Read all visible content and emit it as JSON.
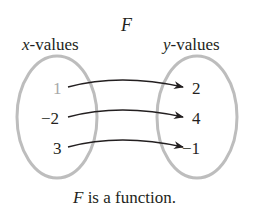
{
  "diagram": {
    "title": "F",
    "domain_label_var": "x",
    "domain_label_rest": "-values",
    "range_label_var": "y",
    "range_label_rest": "-values",
    "domain_values": [
      "1",
      "−2",
      "3"
    ],
    "range_values": [
      "2",
      "4",
      "−1"
    ],
    "mappings": [
      {
        "from": "1",
        "to": "2"
      },
      {
        "from": "−2",
        "to": "4"
      },
      {
        "from": "3",
        "to": "−1"
      }
    ],
    "caption_var": "F",
    "caption_rest": " is a function.",
    "colors": {
      "ellipse": "#bdbdbd",
      "text": "#231f20",
      "faded_value": "#a8a8a8",
      "arrow": "#231f20"
    }
  }
}
